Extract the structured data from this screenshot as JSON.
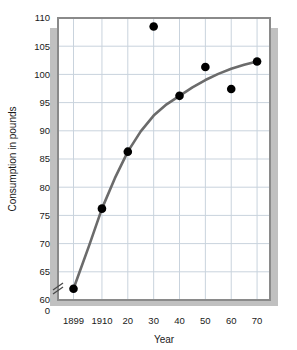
{
  "chart_data": {
    "type": "scatter",
    "title": "",
    "xlabel": "Year",
    "ylabel": "Consumption in pounds",
    "grid": true,
    "legend": false,
    "axis_break_y": true,
    "xlim": [
      1893,
      1975
    ],
    "ylim": [
      60,
      110
    ],
    "ytick_values": [
      60,
      65,
      70,
      75,
      80,
      85,
      90,
      95,
      100,
      105,
      110
    ],
    "ytick_labels": [
      "60",
      "65",
      "70",
      "75",
      "80",
      "85",
      "90",
      "95",
      "100",
      "105",
      "110"
    ],
    "y_origin_label": "0",
    "xtick_values": [
      1899,
      1910,
      1920,
      1930,
      1940,
      1950,
      1960,
      1970
    ],
    "xtick_labels": [
      "1899",
      "1910",
      "20",
      "30",
      "40",
      "50",
      "60",
      "70"
    ],
    "x": [
      1899,
      1910,
      1920,
      1930,
      1940,
      1950,
      1960,
      1970
    ],
    "y": [
      62.0,
      76.2,
      86.3,
      108.5,
      96.2,
      101.3,
      97.4,
      102.3
    ],
    "points": [
      {
        "x": 1899,
        "y": 62.0,
        "on_curve": true
      },
      {
        "x": 1910,
        "y": 76.2,
        "on_curve": true
      },
      {
        "x": 1920,
        "y": 86.3,
        "on_curve": true
      },
      {
        "x": 1930,
        "y": 108.5,
        "on_curve": false
      },
      {
        "x": 1940,
        "y": 96.2,
        "on_curve": true
      },
      {
        "x": 1950,
        "y": 101.3,
        "on_curve": false
      },
      {
        "x": 1960,
        "y": 97.4,
        "on_curve": false
      },
      {
        "x": 1970,
        "y": 102.3,
        "on_curve": true
      }
    ],
    "fit_curve": {
      "name": "fitted trend",
      "x": [
        1899,
        1905,
        1910,
        1915,
        1920,
        1925,
        1930,
        1935,
        1940,
        1945,
        1950,
        1955,
        1960,
        1965,
        1970
      ],
      "y": [
        62.0,
        69.6,
        76.2,
        81.6,
        86.3,
        89.9,
        92.7,
        94.7,
        96.2,
        97.7,
        99.0,
        100.1,
        101.0,
        101.7,
        102.3
      ]
    },
    "colors": {
      "marker": "#000000",
      "curve": "#6b6b6b",
      "grid": "#c9d3dd",
      "frame": "#8a8a8a",
      "shadow": "#c0c0c0",
      "plot_background": "#ffffff",
      "text": "#1a1a1a"
    }
  }
}
